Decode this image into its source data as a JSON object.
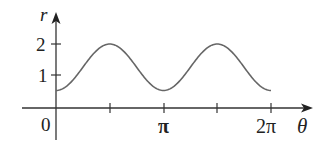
{
  "chart_data": {
    "type": "line",
    "title": "",
    "xlabel": "θ",
    "ylabel": "r",
    "function": "r = 1.25 - 0.75 cos(2θ)",
    "x_range": [
      0,
      6.2832
    ],
    "ylim": [
      0,
      2
    ],
    "x_ticks": [
      {
        "value": 0,
        "label": "0"
      },
      {
        "value": 1.5708,
        "label": ""
      },
      {
        "value": 3.1416,
        "label": "π"
      },
      {
        "value": 4.7124,
        "label": ""
      },
      {
        "value": 6.2832,
        "label": "2π"
      }
    ],
    "y_ticks": [
      {
        "value": 1,
        "label": "1"
      },
      {
        "value": 2,
        "label": "2"
      }
    ],
    "x": [
      0,
      0.7854,
      1.5708,
      2.3562,
      3.1416,
      3.927,
      4.7124,
      5.4978,
      6.2832
    ],
    "values": [
      0.5,
      1.25,
      2.0,
      1.25,
      0.5,
      1.25,
      2.0,
      1.25,
      0.5
    ],
    "grid": false,
    "legend": null
  },
  "labels": {
    "origin": "0",
    "pi": "π",
    "two_pi": "2π",
    "theta": "θ",
    "r": "r",
    "y1": "1",
    "y2": "2"
  },
  "colors": {
    "axis": "#333333",
    "curve": "#666666"
  }
}
